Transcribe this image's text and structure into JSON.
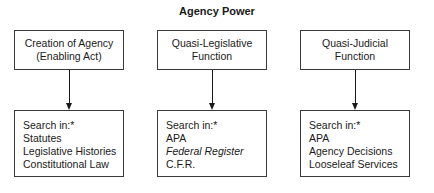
{
  "title": "Agency Power",
  "columns": [
    {
      "header": [
        "Creation of Agency",
        "(Enabling Act)"
      ],
      "search_label": "Search in:*",
      "items": [
        "Statutes",
        "Legislative Histories",
        "Constitutional Law"
      ]
    },
    {
      "header": [
        "Quasi-Legislative",
        "Function"
      ],
      "search_label": "Search in:*",
      "items": [
        "APA",
        "Federal Register",
        "C.F.R."
      ]
    },
    {
      "header": [
        "Quasi-Judicial",
        "Function"
      ],
      "search_label": "Search in:*",
      "items": [
        "APA",
        "Agency Decisions",
        "Looseleaf Services"
      ]
    }
  ]
}
